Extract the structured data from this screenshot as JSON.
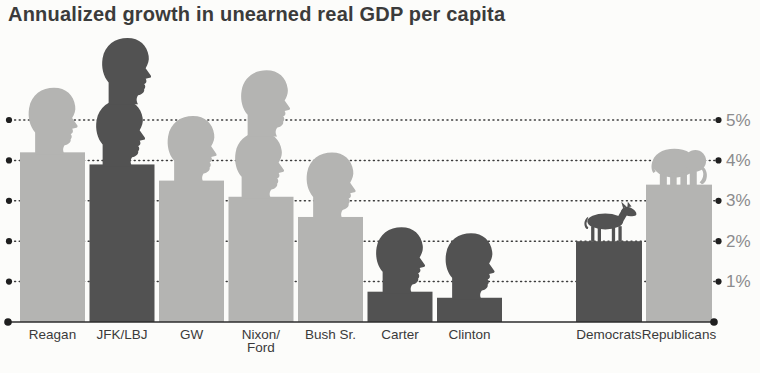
{
  "title": "Annualized growth in unearned real GDP per capita",
  "colors": {
    "democrat": "#525252",
    "republican": "#b4b4b2",
    "axis": "#2d2d2d",
    "grid": "#3c3c3c",
    "title_text": "#3b3b3b",
    "label_text": "#3a3a3a",
    "tick_text": "#8b8b8d",
    "background": "#fcfcfa"
  },
  "chart_data": {
    "type": "bar",
    "title": "Annualized growth in unearned real GDP per capita",
    "unit": "percent annualized growth",
    "ylim": [
      0,
      5
    ],
    "ytick_values": [
      1,
      2,
      3,
      4,
      5
    ],
    "yticks": [
      "1%",
      "2%",
      "3%",
      "4%",
      "5%"
    ],
    "grid": "dotted horizontal lines, dot markers at both ends, y-axis labels on right",
    "legend": "bar color encodes party: dark gray = Democrat, light gray = Republican; president head silhouettes above bars; donkey icon on Democrats bar, elephant icon on Republicans bar",
    "groups": [
      {
        "name": "presidents",
        "bars": [
          {
            "label": "Reagan",
            "label_lines": [
              "Reagan"
            ],
            "value": 4.2,
            "party": "R",
            "heads": 1
          },
          {
            "label": "JFK/LBJ",
            "label_lines": [
              "JFK/LBJ"
            ],
            "value": 3.9,
            "party": "D",
            "heads": 2
          },
          {
            "label": "GW",
            "label_lines": [
              "GW"
            ],
            "value": 3.5,
            "party": "R",
            "heads": 1
          },
          {
            "label": "Nixon/Ford",
            "label_lines": [
              "Nixon/",
              "Ford"
            ],
            "value": 3.1,
            "party": "R",
            "heads": 2
          },
          {
            "label": "Bush Sr.",
            "label_lines": [
              "Bush Sr."
            ],
            "value": 2.6,
            "party": "R",
            "heads": 1
          },
          {
            "label": "Carter",
            "label_lines": [
              "Carter"
            ],
            "value": 0.75,
            "party": "D",
            "heads": 1
          },
          {
            "label": "Clinton",
            "label_lines": [
              "Clinton"
            ],
            "value": 0.6,
            "party": "D",
            "heads": 1
          }
        ]
      },
      {
        "name": "parties",
        "bars": [
          {
            "label": "Democrats",
            "label_lines": [
              "Democrats"
            ],
            "value": 2.0,
            "party": "D",
            "icon": "donkey-icon"
          },
          {
            "label": "Republicans",
            "label_lines": [
              "Republicans"
            ],
            "value": 3.4,
            "party": "R",
            "icon": "elephant-icon"
          }
        ]
      }
    ]
  }
}
